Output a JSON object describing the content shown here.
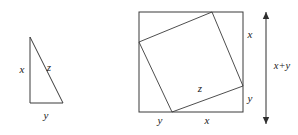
{
  "figure": {
    "stroke_color": "#3a3a3a",
    "background_color": "#ffffff",
    "label_color": "#1a1a1a"
  },
  "triangle": {
    "name": "right-triangle",
    "vertices": {
      "apex": [
        30,
        37
      ],
      "bottom_left": [
        30,
        103
      ],
      "bottom_right": [
        63,
        103
      ]
    },
    "labels": {
      "leg_vertical": "x",
      "hypotenuse": "z",
      "leg_horizontal": "y"
    },
    "label_positions": {
      "leg_vertical": [
        22,
        70
      ],
      "hypotenuse": [
        49,
        68
      ],
      "leg_horizontal": [
        46,
        116
      ]
    }
  },
  "square_figure": {
    "name": "inscribed-square",
    "outer_square": {
      "left": 139,
      "top": 12,
      "right": 243,
      "bottom": 112
    },
    "inner_square_vertices": {
      "top": [
        212,
        12
      ],
      "right": [
        243,
        86
      ],
      "bottom": [
        172,
        112
      ],
      "left": [
        139,
        42
      ]
    },
    "labels": {
      "right_upper": "x",
      "right_lower": "y",
      "bottom_left": "y",
      "bottom_right": "x",
      "inner_hypotenuse": "z"
    },
    "label_positions": {
      "right_upper": [
        250,
        35
      ],
      "right_lower": [
        250,
        99
      ],
      "bottom_left": [
        160,
        121
      ],
      "bottom_right": [
        207,
        121
      ],
      "inner_hypotenuse": [
        200,
        89
      ]
    }
  },
  "dimension_arrow": {
    "name": "total-height-arrow",
    "label": "x+y",
    "x": 266,
    "top": 12,
    "bottom": 124,
    "label_position": [
      282,
      67
    ]
  }
}
